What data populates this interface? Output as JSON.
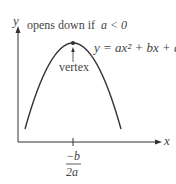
{
  "diagram": {
    "title_note": "opens down if",
    "condition": "a < 0",
    "equation": "y = ax² + bx + c",
    "vertex_label": "vertex",
    "axes": {
      "x_label": "x",
      "y_label": "y"
    },
    "x_tick": {
      "numerator": "−b",
      "denominator": "2a"
    },
    "colors": {
      "curve": "#333333",
      "axes": "#333333",
      "text": "#444444"
    }
  }
}
